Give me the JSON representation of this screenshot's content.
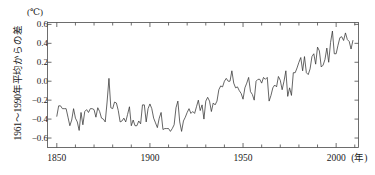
{
  "chart_data": {
    "type": "line",
    "title": "",
    "subtitle": "",
    "xlabel": "(年)",
    "ylabel": "1961～1990年平均からの差",
    "unit_label": "(℃)",
    "xlim": [
      1845,
      2012
    ],
    "ylim": [
      -0.7,
      0.62
    ],
    "grid": false,
    "legend": "none",
    "x_major_ticks": [
      1850,
      1900,
      1950,
      2000
    ],
    "x_major_tick_labels": [
      "1850",
      "1900",
      "1950",
      "2000"
    ],
    "x_minor_tick_interval": 10,
    "y_ticks": [
      0.6,
      0.4,
      0.2,
      0.0,
      -0.2,
      -0.4,
      -0.6
    ],
    "y_tick_labels": [
      "0.6",
      "0.4",
      "0.2",
      "0.0",
      "-0.2",
      "-0.4",
      "-0.6"
    ],
    "line_color": "#333333",
    "series": [
      {
        "name": "global temperature anomaly",
        "x": [
          1850,
          1851,
          1852,
          1853,
          1854,
          1855,
          1856,
          1857,
          1858,
          1859,
          1860,
          1861,
          1862,
          1863,
          1864,
          1865,
          1866,
          1867,
          1868,
          1869,
          1870,
          1871,
          1872,
          1873,
          1874,
          1875,
          1876,
          1877,
          1878,
          1879,
          1880,
          1881,
          1882,
          1883,
          1884,
          1885,
          1886,
          1887,
          1888,
          1889,
          1890,
          1891,
          1892,
          1893,
          1894,
          1895,
          1896,
          1897,
          1898,
          1899,
          1900,
          1901,
          1902,
          1903,
          1904,
          1905,
          1906,
          1907,
          1908,
          1909,
          1910,
          1911,
          1912,
          1913,
          1914,
          1915,
          1916,
          1917,
          1918,
          1919,
          1920,
          1921,
          1922,
          1923,
          1924,
          1925,
          1926,
          1927,
          1928,
          1929,
          1930,
          1931,
          1932,
          1933,
          1934,
          1935,
          1936,
          1937,
          1938,
          1939,
          1940,
          1941,
          1942,
          1943,
          1944,
          1945,
          1946,
          1947,
          1948,
          1949,
          1950,
          1951,
          1952,
          1953,
          1954,
          1955,
          1956,
          1957,
          1958,
          1959,
          1960,
          1961,
          1962,
          1963,
          1964,
          1965,
          1966,
          1967,
          1968,
          1969,
          1970,
          1971,
          1972,
          1973,
          1974,
          1975,
          1976,
          1977,
          1978,
          1979,
          1980,
          1981,
          1982,
          1983,
          1984,
          1985,
          1986,
          1987,
          1988,
          1989,
          1990,
          1991,
          1992,
          1993,
          1994,
          1995,
          1996,
          1997,
          1998,
          1999,
          2000,
          2001,
          2002,
          2003,
          2004,
          2005,
          2006,
          2007,
          2008,
          2009
        ],
        "values": [
          -0.37,
          -0.26,
          -0.26,
          -0.29,
          -0.29,
          -0.29,
          -0.38,
          -0.47,
          -0.41,
          -0.29,
          -0.39,
          -0.43,
          -0.52,
          -0.33,
          -0.46,
          -0.32,
          -0.3,
          -0.33,
          -0.29,
          -0.29,
          -0.3,
          -0.38,
          -0.28,
          -0.32,
          -0.39,
          -0.4,
          -0.43,
          -0.22,
          0.03,
          -0.28,
          -0.29,
          -0.22,
          -0.23,
          -0.31,
          -0.43,
          -0.42,
          -0.39,
          -0.43,
          -0.35,
          -0.27,
          -0.47,
          -0.41,
          -0.47,
          -0.47,
          -0.42,
          -0.45,
          -0.25,
          -0.25,
          -0.43,
          -0.29,
          -0.24,
          -0.29,
          -0.39,
          -0.44,
          -0.49,
          -0.39,
          -0.33,
          -0.51,
          -0.5,
          -0.5,
          -0.5,
          -0.53,
          -0.5,
          -0.46,
          -0.28,
          -0.21,
          -0.43,
          -0.53,
          -0.42,
          -0.38,
          -0.33,
          -0.29,
          -0.34,
          -0.32,
          -0.34,
          -0.27,
          -0.2,
          -0.31,
          -0.25,
          -0.4,
          -0.21,
          -0.17,
          -0.21,
          -0.32,
          -0.23,
          -0.25,
          -0.21,
          -0.09,
          -0.05,
          -0.06,
          0.0,
          0.03,
          0.0,
          0.0,
          0.11,
          -0.02,
          -0.07,
          -0.06,
          -0.1,
          -0.13,
          -0.19,
          -0.07,
          -0.02,
          0.04,
          -0.11,
          -0.14,
          -0.2,
          0.0,
          0.02,
          0.02,
          -0.02,
          0.04,
          0.02,
          0.04,
          -0.21,
          -0.15,
          -0.07,
          -0.04,
          -0.06,
          0.05,
          0.01,
          -0.09,
          0.0,
          0.11,
          -0.16,
          -0.07,
          -0.15,
          0.09,
          0.09,
          0.14,
          0.2,
          0.25,
          0.11,
          0.26,
          0.09,
          0.07,
          0.13,
          0.26,
          0.29,
          0.18,
          0.36,
          0.32,
          0.15,
          0.17,
          0.23,
          0.35,
          0.2,
          0.41,
          0.53,
          0.29,
          0.29,
          0.38,
          0.46,
          0.47,
          0.43,
          0.51,
          0.44,
          0.42,
          0.34,
          0.43
        ]
      }
    ]
  }
}
